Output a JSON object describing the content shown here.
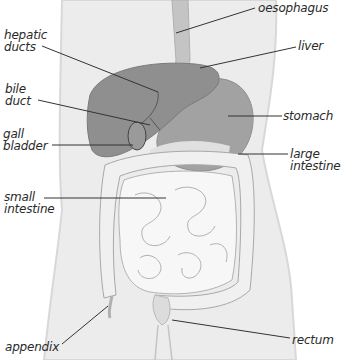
{
  "diagram": {
    "colors": {
      "body": "#e9e9e9",
      "body_edge": "#d6d6d6",
      "liver": "#8e8e8e",
      "stomach": "#9e9e9e",
      "oesophagus": "#c2c2c2",
      "intestine": "#f4f4f4",
      "intestine_line": "#a9a9a9",
      "leader_line": "#333333"
    },
    "labels": [
      {
        "id": "oesophagus",
        "text": "oesophagus",
        "x": 258,
        "y": 2
      },
      {
        "id": "hepatic-ducts",
        "text": "hepatic\nducts",
        "x": 4,
        "y": 29
      },
      {
        "id": "liver",
        "text": "liver",
        "x": 298,
        "y": 40
      },
      {
        "id": "bile-duct",
        "text": "bile\nduct",
        "x": 5,
        "y": 83
      },
      {
        "id": "stomach",
        "text": "stomach",
        "x": 283,
        "y": 106
      },
      {
        "id": "gall-bladder",
        "text": "gall\nbladder",
        "x": 3,
        "y": 126
      },
      {
        "id": "large-intestine",
        "text": "large\nintestine",
        "x": 290,
        "y": 148
      },
      {
        "id": "small-intestine",
        "text": "small\nintestine",
        "x": 4,
        "y": 191
      },
      {
        "id": "appendix",
        "text": "appendix",
        "x": 5,
        "y": 341
      },
      {
        "id": "rectum",
        "text": "rectum",
        "x": 292,
        "y": 338
      }
    ]
  }
}
